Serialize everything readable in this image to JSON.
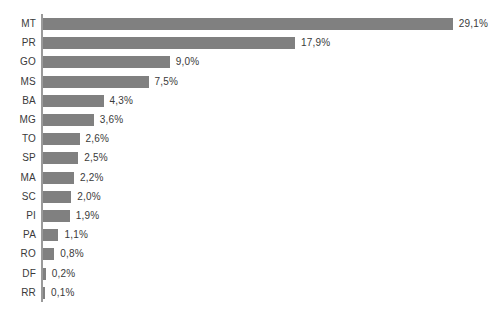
{
  "chart_data": {
    "type": "bar",
    "orientation": "horizontal",
    "title": "",
    "subtitle": "",
    "xlabel": "",
    "ylabel": "",
    "grid": false,
    "legend": null,
    "xlim": [
      0,
      29.1
    ],
    "value_suffix": "%",
    "decimal_separator": ",",
    "categories": [
      "MT",
      "PR",
      "GO",
      "MS",
      "BA",
      "MG",
      "TO",
      "SP",
      "MA",
      "SC",
      "PI",
      "PA",
      "RO",
      "DF",
      "RR"
    ],
    "values": [
      29.1,
      17.9,
      9.0,
      7.5,
      4.3,
      3.6,
      2.6,
      2.5,
      2.2,
      2.0,
      1.9,
      1.1,
      0.8,
      0.2,
      0.1
    ],
    "value_labels": [
      "29,1%",
      "17,9%",
      "9,0%",
      "7,5%",
      "4,3%",
      "3,6%",
      "2,6%",
      "2,5%",
      "2,2%",
      "2,0%",
      "1,9%",
      "1,1%",
      "0,8%",
      "0,2%",
      "0,1%"
    ],
    "bars": [
      {
        "category": "MT",
        "value": 29.1,
        "label": "29,1%"
      },
      {
        "category": "PR",
        "value": 17.9,
        "label": "17,9%"
      },
      {
        "category": "GO",
        "value": 9.0,
        "label": "9,0%"
      },
      {
        "category": "MS",
        "value": 7.5,
        "label": "7,5%"
      },
      {
        "category": "BA",
        "value": 4.3,
        "label": "4,3%"
      },
      {
        "category": "MG",
        "value": 3.6,
        "label": "3,6%"
      },
      {
        "category": "TO",
        "value": 2.6,
        "label": "2,6%"
      },
      {
        "category": "SP",
        "value": 2.5,
        "label": "2,5%"
      },
      {
        "category": "MA",
        "value": 2.2,
        "label": "2,2%"
      },
      {
        "category": "SC",
        "value": 2.0,
        "label": "2,0%"
      },
      {
        "category": "PI",
        "value": 1.9,
        "label": "1,9%"
      },
      {
        "category": "PA",
        "value": 1.1,
        "label": "1,1%"
      },
      {
        "category": "RO",
        "value": 0.8,
        "label": "0,8%"
      },
      {
        "category": "DF",
        "value": 0.2,
        "label": "0,2%"
      },
      {
        "category": "RR",
        "value": 0.1,
        "label": "0,1%"
      }
    ]
  },
  "style": {
    "bar_color": "#808080",
    "axis_color": "#9a9a9a",
    "text_color": "#3a3a3a",
    "background": "#ffffff"
  }
}
